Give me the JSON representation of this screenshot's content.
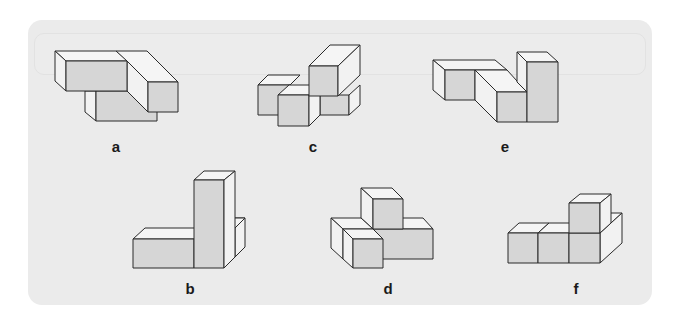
{
  "puzzle": {
    "figures": [
      {
        "id": "a",
        "label": "a",
        "label_pos": [
          116,
          147
        ]
      },
      {
        "id": "c",
        "label": "c",
        "label_pos": [
          313,
          147
        ]
      },
      {
        "id": "e",
        "label": "e",
        "label_pos": [
          505,
          147
        ]
      },
      {
        "id": "b",
        "label": "b",
        "label_pos": [
          190,
          289
        ]
      },
      {
        "id": "d",
        "label": "d",
        "label_pos": [
          388,
          289
        ]
      },
      {
        "id": "f",
        "label": "f",
        "label_pos": [
          576,
          289
        ]
      }
    ],
    "colors": {
      "panel": "#ebebeb",
      "front_face": "#d6d6d6",
      "side_face": "#f2f2f2",
      "top_face": "#f4f4f4",
      "stroke": "#2a2a2a"
    }
  }
}
